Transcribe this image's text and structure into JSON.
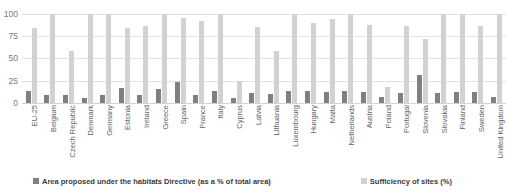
{
  "chart_data": {
    "type": "bar",
    "title": "",
    "xlabel": "",
    "ylabel": "",
    "ylim": [
      0,
      100
    ],
    "yticks": [
      0,
      25,
      50,
      75,
      100
    ],
    "grid": true,
    "legend_position": "bottom",
    "categories": [
      "EU-25",
      "Belgium",
      "Czech Republic",
      "Denmark",
      "Germany",
      "Estonia",
      "Ireland",
      "Greece",
      "Spain",
      "France",
      "Italy",
      "Cyprus",
      "Latvia",
      "Lithuania",
      "Luxembourg",
      "Hungary",
      "Malta",
      "Netherlands",
      "Austria",
      "Poland",
      "Portugal",
      "Slovenia",
      "Slovakia",
      "Finland",
      "Sweden",
      "United Kingdom"
    ],
    "series": [
      {
        "name": "Area proposed under the habitats Directive (as a % of total area)",
        "color": "#808080",
        "values": [
          13,
          9,
          9,
          6,
          9,
          17,
          9,
          16,
          24,
          9,
          14,
          6,
          11,
          10,
          14,
          13,
          12,
          13,
          12,
          7,
          11,
          32,
          11,
          12,
          12,
          7
        ]
      },
      {
        "name": "Sufficiency of sites (%)",
        "color": "#d2d2d2",
        "values": [
          84,
          100,
          59,
          100,
          100,
          84,
          86,
          100,
          96,
          92,
          100,
          25,
          85,
          58,
          100,
          90,
          94,
          100,
          88,
          18,
          87,
          72,
          100,
          100,
          87,
          100
        ]
      }
    ]
  },
  "legend": {
    "items": [
      {
        "label": "Area proposed under the habitats Directive (as a % of total area)",
        "swatch": "dark-swatch-icon"
      },
      {
        "label": "Sufficiency of sites (%)",
        "swatch": "light-swatch-icon"
      }
    ]
  },
  "axis": {
    "y_tick_labels": [
      "100",
      "75",
      "50",
      "25",
      "0"
    ]
  },
  "title_sliver": ""
}
